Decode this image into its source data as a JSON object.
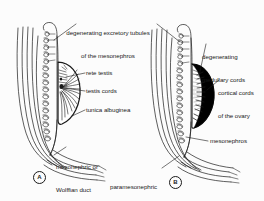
{
  "figure": {
    "background_color": "#fcfcfc",
    "ink_color": "#1a1a1a",
    "fill_color": "#000000"
  },
  "panels": [
    {
      "id": "A",
      "letter": "A",
      "subject": "testis",
      "labels": [
        {
          "name": "degenerating-excretory-tubules-label",
          "line1": "degenerating excretory tubules",
          "line2": "of the mesonephros"
        },
        {
          "name": "rete-testis-label",
          "text": "rete testis"
        },
        {
          "name": "testis-cords-label",
          "text": "testis cords"
        },
        {
          "name": "tunica-albuginea-label",
          "text": "tunica albuginea"
        },
        {
          "name": "mesonephric-duct-label",
          "line1": "mesonephric or",
          "line2": "Wolffian duct"
        }
      ]
    },
    {
      "id": "B",
      "letter": "B",
      "subject": "ovary",
      "labels": [
        {
          "name": "degenerating-medullary-cords-label",
          "line1": "degenerating",
          "line2": "medullary cords"
        },
        {
          "name": "cortical-cords-label",
          "line1": "cortical cords",
          "line2": "of the ovary"
        },
        {
          "name": "mesonephros-label",
          "text": "mesonephros"
        },
        {
          "name": "paramesonephric-duct-label",
          "line1": "paramesonephric",
          "line2": "or Müllerian duct"
        }
      ]
    }
  ]
}
